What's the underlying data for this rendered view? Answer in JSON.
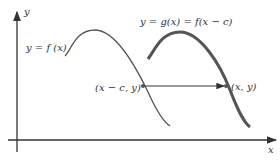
{
  "diagram": {
    "axes": {
      "x_label": "x",
      "y_label": "y"
    },
    "curves": [
      {
        "name": "f",
        "label": "y = f (x)",
        "color": "#555555",
        "stroke_width": 1.3
      },
      {
        "name": "g",
        "label": "y = g(x) = f(x − c)",
        "color": "#555555",
        "stroke_width": 3
      }
    ],
    "points": [
      {
        "label": "(x − c, y)"
      },
      {
        "label": "(x, y)"
      }
    ],
    "arrow": {
      "from": "(x − c, y)",
      "to": "(x, y)",
      "color": "#333333"
    }
  }
}
